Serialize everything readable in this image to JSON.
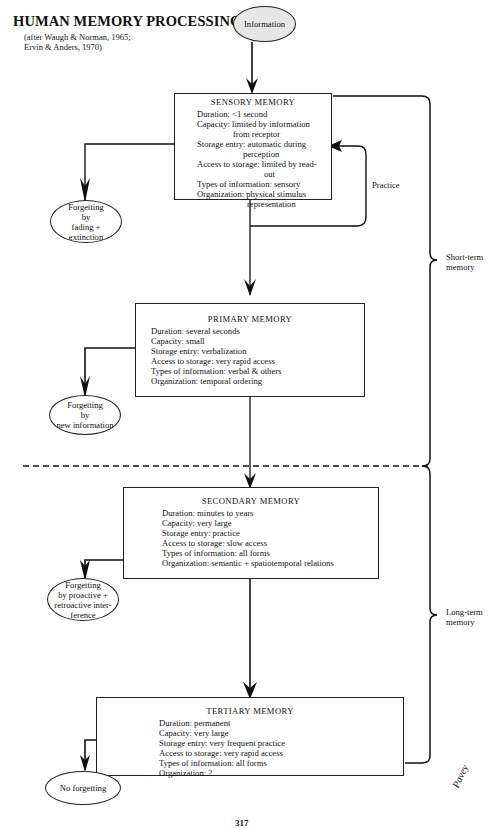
{
  "title": "HUMAN MEMORY PROCESSING",
  "subtitle": [
    "(after Waugh & Norman, 1965;",
    "Ervin & Anders, 1970)"
  ],
  "start_node": "Information",
  "stores": [
    {
      "name": "SENSORY MEMORY",
      "lines": [
        "Duration: <1 second",
        "Capacity: limited by information",
        "from receptor",
        "Storage entry: automatic during",
        "perception",
        "Access to storage: limited by read-",
        "out",
        "Types of information: sensory",
        "Organization: physical stimulus",
        "representation"
      ]
    },
    {
      "name": "PRIMARY MEMORY",
      "lines": [
        "Duration: several seconds",
        "Capacity: small",
        "Storage entry: verbalization",
        "Access to storage: very rapid access",
        "Types of information: verbal & others",
        "Organization: temporal ordering"
      ]
    },
    {
      "name": "SECONDARY MEMORY",
      "lines": [
        "Duration: minutes to years",
        "Capacity: very large",
        "Storage entry: practice",
        "Access to storage: slow access",
        "Types of information: all forms",
        "Organization: semantic + spatiotemporal relations"
      ]
    },
    {
      "name": "TERTIARY MEMORY",
      "lines": [
        "Duration: permanent",
        "Capacity: very large",
        "Storage entry: very frequent practice",
        "Access to storage: very rapid access",
        "Types of information: all forms",
        "Organization: ?"
      ]
    }
  ],
  "forgetting": [
    [
      "Forgetting",
      "by",
      "fading +",
      "extinction"
    ],
    [
      "Forgetting",
      "by",
      "new information"
    ],
    [
      "Forgetting",
      "by proactive +",
      "retroactive inter-",
      "ference"
    ],
    [
      "No forgetting"
    ]
  ],
  "loop_label": "Practice",
  "brackets": [
    [
      "Short-term",
      "memory"
    ],
    [
      "Long-term",
      "memory"
    ]
  ],
  "signature": "Pavey",
  "page_number": "317"
}
